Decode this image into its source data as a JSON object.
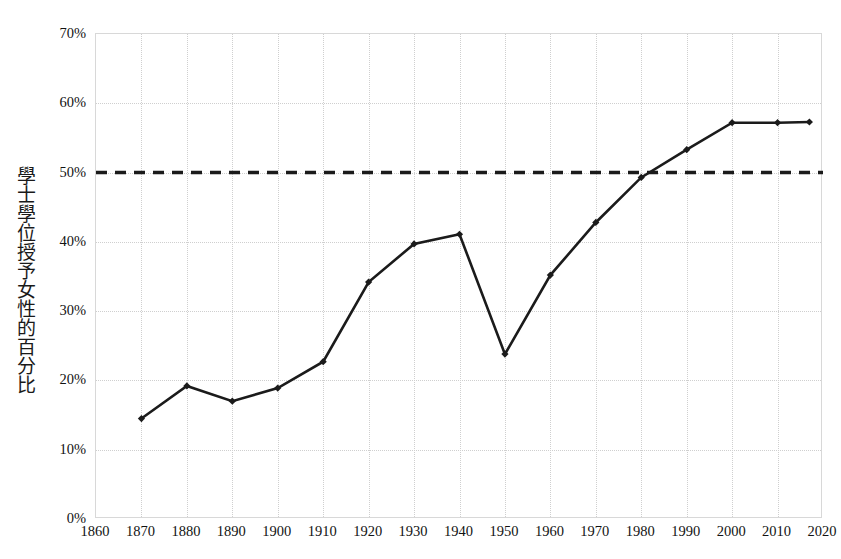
{
  "chart_data": {
    "type": "line",
    "title": "",
    "subtitle": "",
    "xlabel": "",
    "ylabel": "學士學位授予女性的百分比",
    "x": [
      1870,
      1880,
      1890,
      1900,
      1910,
      1920,
      1930,
      1940,
      1950,
      1960,
      1970,
      1980,
      1990,
      2000,
      2010,
      2017
    ],
    "values": [
      14.5,
      19.2,
      17.0,
      18.9,
      22.7,
      34.2,
      39.7,
      41.1,
      23.8,
      35.2,
      42.8,
      49.3,
      53.3,
      57.2,
      57.2,
      57.3
    ],
    "series": [
      {
        "name": "學士學位授予女性的百分比",
        "values": [
          14.5,
          19.2,
          17.0,
          18.9,
          22.7,
          34.2,
          39.7,
          41.1,
          23.8,
          35.2,
          42.8,
          49.3,
          53.3,
          57.2,
          57.2,
          57.3
        ]
      }
    ],
    "reference_line": {
      "value": 50,
      "label": "50%",
      "style": "dashed",
      "color": "#1b1b1b"
    },
    "xlim": [
      1860,
      2020
    ],
    "ylim": [
      0,
      70
    ],
    "x_ticks": [
      1860,
      1870,
      1880,
      1890,
      1900,
      1910,
      1920,
      1930,
      1940,
      1950,
      1960,
      1970,
      1980,
      1990,
      2000,
      2010,
      2020
    ],
    "x_tick_labels": [
      "1860",
      "1870",
      "1880",
      "1890",
      "1900",
      "1910",
      "1920",
      "1930",
      "1940",
      "1950",
      "1960",
      "1970",
      "1980",
      "1990",
      "2000",
      "2010",
      "2020"
    ],
    "y_ticks": [
      0,
      10,
      20,
      30,
      40,
      50,
      60,
      70
    ],
    "y_tick_labels": [
      "0%",
      "10%",
      "20%",
      "30%",
      "40%",
      "50%",
      "60%",
      "70%"
    ],
    "grid": true,
    "grid_style": "dotted",
    "grid_color": "#cfcfcf",
    "legend": "none",
    "line_color": "#1b1b1b",
    "marker": "diamond",
    "background": "#ffffff"
  }
}
